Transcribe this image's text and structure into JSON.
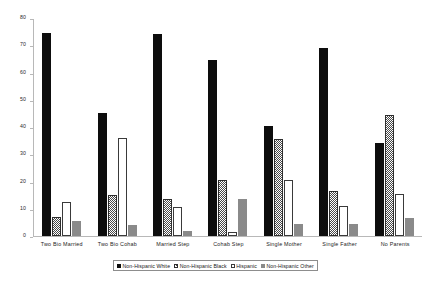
{
  "chart_data": {
    "type": "bar",
    "title": "",
    "subtitle": "",
    "xlabel": "",
    "ylabel": "",
    "ylim": [
      0,
      80
    ],
    "ytick_labels": [
      "80",
      "70",
      "60",
      "50",
      "40",
      "30",
      "20",
      "10",
      "0"
    ],
    "ytick_values": [
      80,
      70,
      60,
      50,
      40,
      30,
      20,
      10,
      0
    ],
    "grid": false,
    "legend_position": "bottom",
    "categories": [
      "Two Bio Married",
      "Two Bio Cohab",
      "Married Step",
      "Cohab Step",
      "Single Mother",
      "Single Father",
      "No Parents"
    ],
    "series": [
      {
        "name": "Non-Hispanic White",
        "pattern": "solid-black",
        "color": "#0d0d0d",
        "values": [
          74.5,
          45.0,
          74.0,
          64.5,
          40.5,
          69.0,
          34.0
        ]
      },
      {
        "name": "Non-Hispanic Black",
        "pattern": "checkered",
        "color": "#4a4a4a",
        "values": [
          7.0,
          15.0,
          13.5,
          20.5,
          35.5,
          16.5,
          44.5
        ]
      },
      {
        "name": "Hispanic",
        "pattern": "open-white",
        "color": "#ffffff",
        "values": [
          12.5,
          36.0,
          10.5,
          1.5,
          20.5,
          11.0,
          15.5
        ]
      },
      {
        "name": "Non-Hispanic Other",
        "pattern": "solid-gray",
        "color": "#8a8a8a",
        "values": [
          5.5,
          4.0,
          2.0,
          13.5,
          4.5,
          4.5,
          6.5
        ]
      }
    ]
  }
}
